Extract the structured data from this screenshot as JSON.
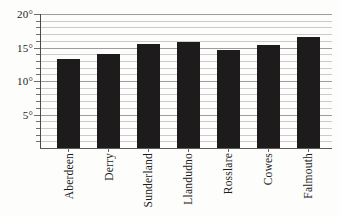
{
  "figure": {
    "background": "#fdfdfb"
  },
  "chart_data": {
    "type": "bar",
    "categories": [
      "Aberdeen",
      "Derry",
      "Sunderland",
      "Llandudno",
      "Rosslare",
      "Cowes",
      "Falmouth"
    ],
    "values": [
      13.3,
      14.1,
      15.5,
      15.8,
      14.6,
      15.4,
      16.6
    ],
    "title": "",
    "xlabel": "",
    "ylabel": "",
    "ylim": [
      0,
      20
    ],
    "ytick_major_step": 5,
    "ytick_minor_step": 1,
    "ytick_labels": [
      "5°",
      "10°",
      "15°",
      "20°"
    ],
    "ytick_label_suffix": "°",
    "grid": "horizontal, minor every 1, major every 5",
    "legend": "none",
    "bar_color": "#1d1b1b",
    "grid_minor_color": "#cbcbcb",
    "grid_major_color": "#9d9d9d",
    "axis_color": "#4a4a4a",
    "text_color": "#1b1b1b"
  }
}
